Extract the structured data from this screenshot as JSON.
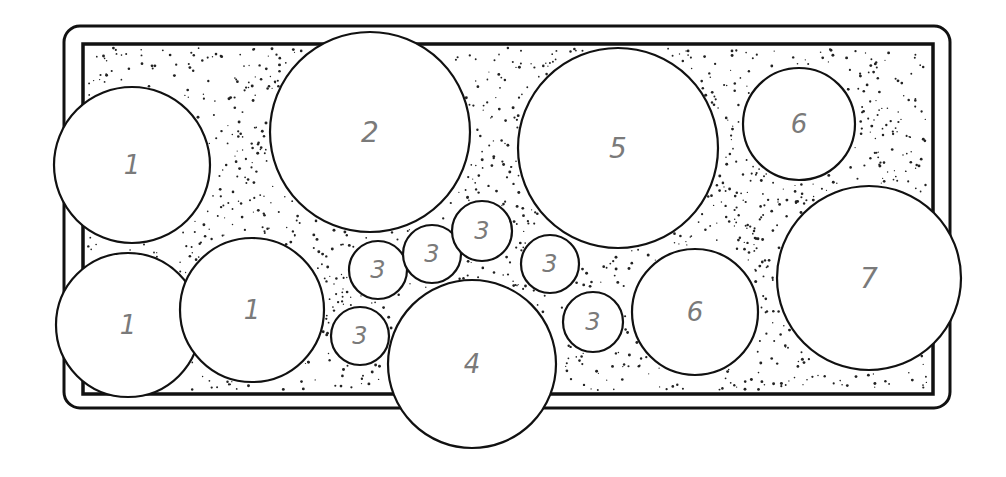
{
  "diagram": {
    "title": "",
    "colors": {
      "line": "#111111",
      "label": "#7a7a7a",
      "background": "#ffffff",
      "stipple": "#222222"
    },
    "bed": {
      "outer": {
        "x": 64,
        "y": 26,
        "width": 886,
        "height": 382,
        "rx": 16
      },
      "inner": {
        "x": 83,
        "y": 44,
        "width": 850,
        "height": 350
      }
    },
    "plants": [
      {
        "id": "p1a",
        "label": "1",
        "cx": 132,
        "cy": 165,
        "r": 78,
        "fs": 26
      },
      {
        "id": "p1b",
        "label": "1",
        "cx": 128,
        "cy": 325,
        "r": 72,
        "fs": 26
      },
      {
        "id": "p1c",
        "label": "1",
        "cx": 252,
        "cy": 310,
        "r": 72,
        "fs": 26
      },
      {
        "id": "p2",
        "label": "2",
        "cx": 370,
        "cy": 132,
        "r": 100,
        "fs": 28
      },
      {
        "id": "p3a",
        "label": "3",
        "cx": 378,
        "cy": 270,
        "r": 29,
        "fs": 24
      },
      {
        "id": "p3b",
        "label": "3",
        "cx": 432,
        "cy": 254,
        "r": 29,
        "fs": 24
      },
      {
        "id": "p3c",
        "label": "3",
        "cx": 482,
        "cy": 231,
        "r": 30,
        "fs": 24
      },
      {
        "id": "p3d",
        "label": "3",
        "cx": 360,
        "cy": 336,
        "r": 29,
        "fs": 24
      },
      {
        "id": "p3e",
        "label": "3",
        "cx": 550,
        "cy": 264,
        "r": 29,
        "fs": 24
      },
      {
        "id": "p3f",
        "label": "3",
        "cx": 593,
        "cy": 322,
        "r": 30,
        "fs": 24
      },
      {
        "id": "p4",
        "label": "4",
        "cx": 472,
        "cy": 364,
        "r": 84,
        "fs": 26
      },
      {
        "id": "p5",
        "label": "5",
        "cx": 618,
        "cy": 148,
        "r": 100,
        "fs": 28
      },
      {
        "id": "p6a",
        "label": "6",
        "cx": 799,
        "cy": 124,
        "r": 56,
        "fs": 26
      },
      {
        "id": "p6b",
        "label": "6",
        "cx": 695,
        "cy": 312,
        "r": 63,
        "fs": 26
      },
      {
        "id": "p7",
        "label": "7",
        "cx": 869,
        "cy": 278,
        "r": 92,
        "fs": 28
      }
    ]
  }
}
